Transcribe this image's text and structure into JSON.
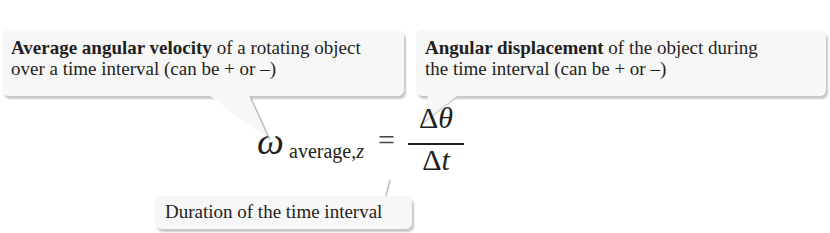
{
  "topline": {
    "text": "...celerity of the ... ... ... ..."
  },
  "callouts": [
    {
      "bold": "Average angular velocity",
      "rest_line1": " of a rotating object",
      "line2": "over a time interval (can be + or –)"
    },
    {
      "bold": "Angular displacement",
      "rest_line1": " of the object during",
      "line2": "the time interval (can be + or –)"
    },
    {
      "text": "Duration of the time interval"
    }
  ],
  "formula": {
    "omega": "ω",
    "subscript_text": "average,",
    "subscript_var": "z",
    "equals": "=",
    "numerator_delta": "Δ",
    "numerator_var": "θ",
    "denominator_delta": "Δ",
    "denominator_var": "t"
  },
  "colors": {
    "callout_bg": "#f7f7f7",
    "text": "#231f20"
  }
}
